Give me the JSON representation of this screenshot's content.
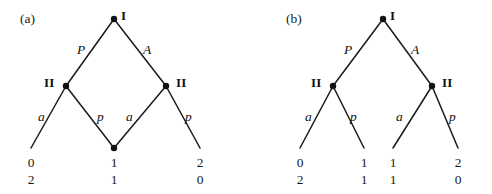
{
  "figure": {
    "width": 492,
    "height": 194,
    "background": "#ffffff",
    "line_color": "#1a1a1a",
    "node_color": "#111111",
    "text_color": "#1a1a1a"
  },
  "panels": [
    {
      "tag": "(a)",
      "tag_pos": {
        "x": 20,
        "y": 12
      },
      "root": {
        "label": "I",
        "label_pos": {
          "x": 121,
          "y": 9
        },
        "pos": {
          "x": 114,
          "y": 19
        }
      },
      "decision_nodes": [
        {
          "label": "II",
          "label_pos": {
            "x": 44,
            "y": 76
          },
          "pos": {
            "x": 66,
            "y": 86
          }
        },
        {
          "label": "II",
          "label_pos": {
            "x": 176,
            "y": 76
          },
          "pos": {
            "x": 166,
            "y": 86
          }
        }
      ],
      "shared_node": {
        "pos": {
          "x": 114,
          "y": 148
        }
      },
      "edges": [
        {
          "from": [
            114,
            19
          ],
          "to": [
            66,
            86
          ],
          "label": "P",
          "label_pos": {
            "x": 77,
            "y": 43
          }
        },
        {
          "from": [
            114,
            19
          ],
          "to": [
            166,
            86
          ],
          "label": "A",
          "label_pos": {
            "x": 143,
            "y": 43
          }
        },
        {
          "from": [
            66,
            86
          ],
          "to": [
            31,
            148
          ],
          "label": "a",
          "label_pos": {
            "x": 38,
            "y": 110
          }
        },
        {
          "from": [
            66,
            86
          ],
          "to": [
            114,
            148
          ],
          "label": "p",
          "label_pos": {
            "x": 97,
            "y": 110
          }
        },
        {
          "from": [
            166,
            86
          ],
          "to": [
            114,
            148
          ],
          "label": "a",
          "label_pos": {
            "x": 126,
            "y": 110
          }
        },
        {
          "from": [
            166,
            86
          ],
          "to": [
            200,
            148
          ],
          "label": "p",
          "label_pos": {
            "x": 185,
            "y": 110
          }
        }
      ],
      "payoffs": [
        {
          "x": 31,
          "y": 154,
          "top": "0",
          "bottom": "2"
        },
        {
          "x": 114,
          "y": 154,
          "top": "1",
          "bottom": "1"
        },
        {
          "x": 200,
          "y": 154,
          "top": "2",
          "bottom": "0"
        }
      ]
    },
    {
      "tag": "(b)",
      "tag_pos": {
        "x": 286,
        "y": 12
      },
      "root": {
        "label": "I",
        "label_pos": {
          "x": 390,
          "y": 9
        },
        "pos": {
          "x": 383,
          "y": 19
        }
      },
      "decision_nodes": [
        {
          "label": "II",
          "label_pos": {
            "x": 311,
            "y": 76
          },
          "pos": {
            "x": 333,
            "y": 86
          }
        },
        {
          "label": "II",
          "label_pos": {
            "x": 442,
            "y": 76
          },
          "pos": {
            "x": 432,
            "y": 86
          }
        }
      ],
      "edges": [
        {
          "from": [
            383,
            19
          ],
          "to": [
            333,
            86
          ],
          "label": "P",
          "label_pos": {
            "x": 344,
            "y": 43
          }
        },
        {
          "from": [
            383,
            19
          ],
          "to": [
            432,
            86
          ],
          "label": "A",
          "label_pos": {
            "x": 411,
            "y": 43
          }
        },
        {
          "from": [
            333,
            86
          ],
          "to": [
            300,
            148
          ],
          "label": "a",
          "label_pos": {
            "x": 305,
            "y": 110
          }
        },
        {
          "from": [
            333,
            86
          ],
          "to": [
            364,
            148
          ],
          "label": "p",
          "label_pos": {
            "x": 350,
            "y": 110
          }
        },
        {
          "from": [
            432,
            86
          ],
          "to": [
            393,
            148
          ],
          "label": "a",
          "label_pos": {
            "x": 396,
            "y": 110
          }
        },
        {
          "from": [
            432,
            86
          ],
          "to": [
            458,
            148
          ],
          "label": "p",
          "label_pos": {
            "x": 449,
            "y": 110
          }
        }
      ],
      "payoffs": [
        {
          "x": 300,
          "y": 154,
          "top": "0",
          "bottom": "2"
        },
        {
          "x": 364,
          "y": 154,
          "top": "1",
          "bottom": "1"
        },
        {
          "x": 393,
          "y": 154,
          "top": "1",
          "bottom": "1"
        },
        {
          "x": 458,
          "y": 154,
          "top": "2",
          "bottom": "0"
        }
      ]
    }
  ]
}
